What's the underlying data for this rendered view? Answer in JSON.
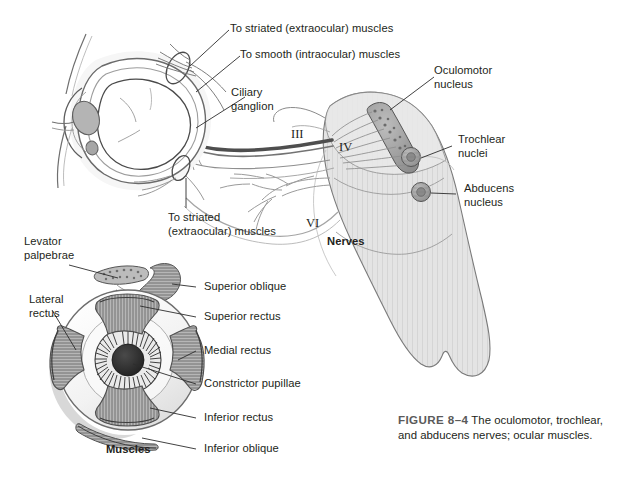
{
  "figure": {
    "number_label": "FIGURE 8–4",
    "caption_text": "The oculomotor, trochlear, and abducens nerves; ocular muscles.",
    "background_color": "#ffffff",
    "ink_color": "#231f20",
    "brainstem_fill": "#e3e3e3",
    "brainstem_stroke": "#6e6e6e",
    "nucleus_fill": "#a9a9a9",
    "nucleus_stroke": "#595959",
    "nerve_dark": "#4a4a4a",
    "nerve_light": "#9a9a9a",
    "muscle_fill": "#9e9e9e",
    "sclera_fill": "#f4f4f4"
  },
  "upper_panel": {
    "name": "Nerves",
    "panel_title": "Nerves",
    "labels": [
      {
        "id": "to-striated-upper",
        "text": "To striated (extraocular) muscles"
      },
      {
        "id": "to-smooth",
        "text": "To smooth (intraocular) muscles"
      },
      {
        "id": "ciliary-ganglion",
        "line1": "Ciliary",
        "line2": "ganglion"
      },
      {
        "id": "to-striated-lower",
        "line1": "To striated",
        "line2": "(extraocular) muscles"
      },
      {
        "id": "oculomotor-nucleus",
        "line1": "Oculomotor",
        "line2": "nucleus"
      },
      {
        "id": "trochlear-nuclei",
        "line1": "Trochlear",
        "line2": "nuclei"
      },
      {
        "id": "abducens-nucleus",
        "line1": "Abducens",
        "line2": "nucleus"
      }
    ],
    "nerve_numerals": [
      {
        "id": "cn-three",
        "text": "III"
      },
      {
        "id": "cn-four",
        "text": "IV"
      },
      {
        "id": "cn-six",
        "text": "VI"
      }
    ]
  },
  "lower_panel": {
    "name": "Muscles",
    "panel_title": "Muscles",
    "labels": [
      {
        "id": "levator-palpebrae",
        "line1": "Levator",
        "line2": "palpebrae"
      },
      {
        "id": "lateral-rectus",
        "line1": "Lateral",
        "line2": "rectus"
      },
      {
        "id": "superior-oblique",
        "text": "Superior oblique"
      },
      {
        "id": "superior-rectus",
        "text": "Superior rectus"
      },
      {
        "id": "medial-rectus",
        "text": "Medial rectus"
      },
      {
        "id": "constrictor-pupillae",
        "text": "Constrictor pupillae"
      },
      {
        "id": "inferior-rectus",
        "text": "Inferior rectus"
      },
      {
        "id": "inferior-oblique",
        "text": "Inferior oblique"
      }
    ]
  }
}
